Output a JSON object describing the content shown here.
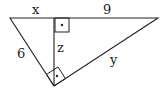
{
  "diagram": {
    "type": "right-triangle-with-altitude",
    "labels": {
      "x": "x",
      "nine": "9",
      "six": "6",
      "z": "z",
      "y": "y"
    },
    "colors": {
      "stroke": "#222222",
      "background": "#ffffff"
    }
  }
}
